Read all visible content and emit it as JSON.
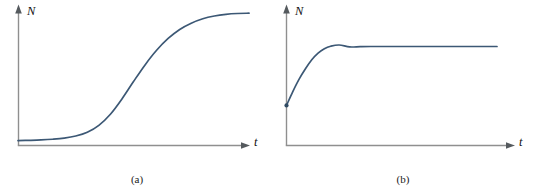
{
  "figure": {
    "background_color": "#ffffff",
    "curve_color": "#3c5875",
    "axis_color": "#8f8f8f",
    "panels": [
      {
        "id": "a",
        "caption": "(a)",
        "y_axis_label": "N",
        "x_axis_label": "t"
      },
      {
        "id": "b",
        "caption": "(b)",
        "y_axis_label": "N",
        "x_axis_label": "t"
      }
    ]
  },
  "chart_data": [
    {
      "type": "line",
      "title": "(a)",
      "xlabel": "t",
      "ylabel": "N",
      "grid": false,
      "legend": "none",
      "axis_arrows": true,
      "xlim": [
        0,
        1
      ],
      "ylim": [
        0,
        1
      ],
      "description": "Sigmoid (logistic) growth curve: slow start near zero, rapid rise through an inflection point, then saturation at a plateau.",
      "series": [
        {
          "name": "logistic growth",
          "color": "#3c5875",
          "x": [
            0.0,
            0.05,
            0.1,
            0.15,
            0.2,
            0.25,
            0.3,
            0.35,
            0.4,
            0.45,
            0.5,
            0.55,
            0.6,
            0.65,
            0.7,
            0.75,
            0.8,
            0.85,
            0.9,
            0.95,
            1.0
          ],
          "y": [
            0.035,
            0.037,
            0.04,
            0.045,
            0.053,
            0.068,
            0.095,
            0.145,
            0.225,
            0.335,
            0.46,
            0.58,
            0.685,
            0.77,
            0.835,
            0.88,
            0.912,
            0.932,
            0.944,
            0.95,
            0.952
          ]
        }
      ]
    },
    {
      "type": "line",
      "title": "(b)",
      "xlabel": "t",
      "ylabel": "N",
      "grid": false,
      "legend": "none",
      "axis_arrows": true,
      "xlim": [
        0,
        1
      ],
      "ylim": [
        0,
        1
      ],
      "description": "Saturating exponential approach: starts at a nonzero value on the N axis, rises steeply, then levels off at a constant plateau.",
      "series": [
        {
          "name": "saturating growth",
          "color": "#3c5875",
          "x": [
            0.0,
            0.03,
            0.06,
            0.09,
            0.12,
            0.15,
            0.18,
            0.21,
            0.25,
            0.3,
            0.35,
            0.4,
            0.5,
            0.6,
            0.7,
            0.8,
            0.9,
            1.0
          ],
          "y": [
            0.29,
            0.39,
            0.48,
            0.555,
            0.62,
            0.668,
            0.7,
            0.718,
            0.727,
            0.713,
            0.715,
            0.716,
            0.716,
            0.716,
            0.716,
            0.716,
            0.716,
            0.716
          ]
        }
      ]
    }
  ]
}
